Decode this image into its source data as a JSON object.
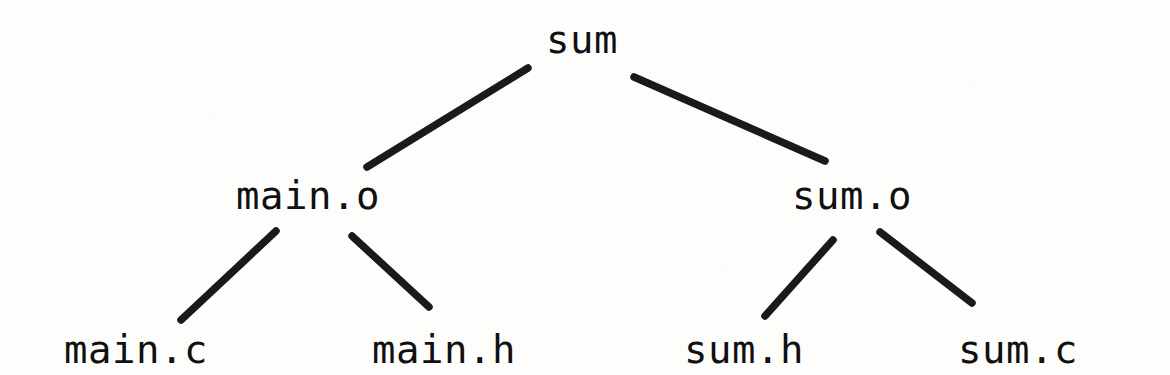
{
  "diagram": {
    "kind": "dependency-tree",
    "background_color": "#fdfdfc",
    "edge_color": "#1a1a1a",
    "text_color": "#101010",
    "nodes": [
      {
        "id": "sum",
        "label": "sum",
        "level": 0,
        "x": 546,
        "y": 20
      },
      {
        "id": "main_o",
        "label": "main.o",
        "level": 1,
        "x": 236,
        "y": 176
      },
      {
        "id": "sum_o",
        "label": "sum.o",
        "level": 1,
        "x": 792,
        "y": 176
      },
      {
        "id": "main_c",
        "label": "main.c",
        "level": 2,
        "x": 64,
        "y": 330
      },
      {
        "id": "main_h",
        "label": "main.h",
        "level": 2,
        "x": 372,
        "y": 330
      },
      {
        "id": "sum_h",
        "label": "sum.h",
        "level": 2,
        "x": 684,
        "y": 330
      },
      {
        "id": "sum_c",
        "label": "sum.c",
        "level": 2,
        "x": 958,
        "y": 330
      }
    ],
    "edges": [
      {
        "id": "sum-main_o",
        "from": "sum",
        "to": "main_o",
        "x1": 528,
        "y1": 68,
        "x2": 367,
        "y2": 167
      },
      {
        "id": "sum-sum_o",
        "from": "sum",
        "to": "sum_o",
        "x1": 634,
        "y1": 77,
        "x2": 825,
        "y2": 161
      },
      {
        "id": "main_o-main_c",
        "from": "main_o",
        "to": "main_c",
        "x1": 276,
        "y1": 231,
        "x2": 181,
        "y2": 320
      },
      {
        "id": "main_o-main_h",
        "from": "main_o",
        "to": "main_h",
        "x1": 352,
        "y1": 236,
        "x2": 429,
        "y2": 307
      },
      {
        "id": "sum_o-sum_h",
        "from": "sum_o",
        "to": "sum_h",
        "x1": 833,
        "y1": 240,
        "x2": 765,
        "y2": 316
      },
      {
        "id": "sum_o-sum_c",
        "from": "sum_o",
        "to": "sum_c",
        "x1": 880,
        "y1": 232,
        "x2": 972,
        "y2": 303
      }
    ]
  }
}
